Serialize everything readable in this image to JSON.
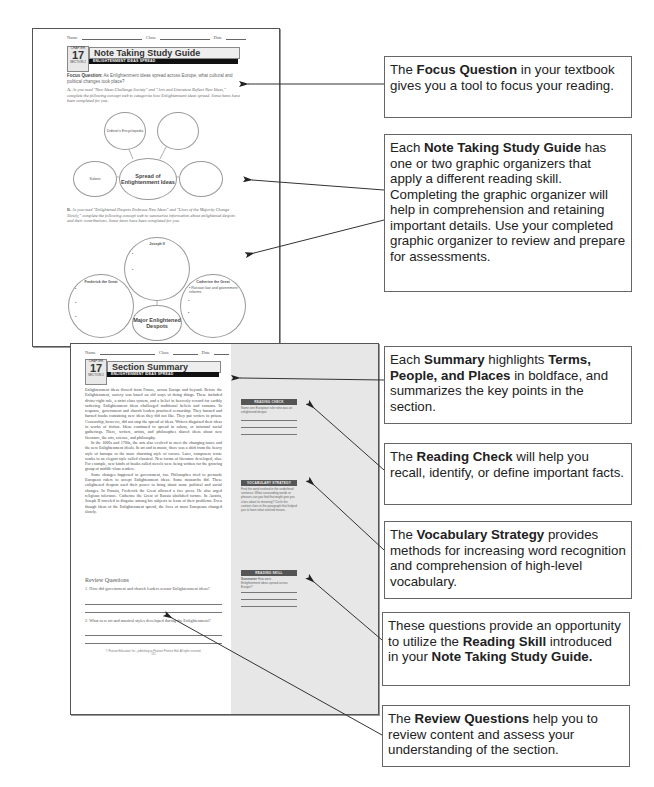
{
  "note_taking_page": {
    "name_label": "Name",
    "class_label": "Class",
    "date_label": "Date",
    "chapter_label": "CHAPTER",
    "chapter_number": "17",
    "section_label": "SECTION 2",
    "title": "Note Taking Study Guide",
    "subtitle": "ENLIGHTENMENT IDEAS SPREAD",
    "focus_question_label": "Focus Question:",
    "focus_question_text": "As Enlightenment ideas spread across Europe, what cultural and political changes took place?",
    "part_a_letter": "A.",
    "part_a_text": "As you read \"New Ideas Challenge Society\" and \"Arts and Literature Reflect New Ideas,\" complete the following concept web to categorize how Enlightenment ideas spread. Some items have been completed for you.",
    "web_a": {
      "center": "Spread of Enlightenment Ideas",
      "top_left": "Diderot's Encyclopedia",
      "top_right": "",
      "left": "Salons",
      "right": ""
    },
    "part_b_letter": "B.",
    "part_b_text": "As you read \"Enlightened Despots Embrace New Ideas\" and \"Lives of the Majority Change Slowly,\" complete the following concept web to summarize information about enlightened despots and their contributions. Some items have been completed for you.",
    "web_b": {
      "center": "Major Enlightened Despots",
      "top": "Joseph II",
      "left": "Frederick the Great",
      "right": "Catherine the Great",
      "right_item": "Russian law and government reforms",
      "bullet": "•"
    }
  },
  "summary_page": {
    "name_label": "Name",
    "class_label": "Class",
    "date_label": "Date",
    "chapter_label": "CHAPTER",
    "chapter_number": "17",
    "section_label": "SECTION 2",
    "title": "Section Summary",
    "subtitle": "ENLIGHTENMENT IDEAS SPREAD",
    "paragraph_1": "Enlightenment ideas flowed from France, across Europe and beyond. Before the Enlightenment, society was based on old ways of doing things. These included divine-right rule, a strict class system, and a belief in heavenly reward for earthly suffering. Enlightenment ideas challenged traditional beliefs and customs. In response, government and church leaders practiced censorship. They banned and burned books containing new ideas they did not like. They put writers in prison. Censorship, however, did not stop the spread of ideas. Writers disguised their ideas in works of fiction. Ideas continued to spread in salons, or informal social gatherings. There, writers, artists, and philosophes shared ideas about new literature, the arts, science, and philosophy.",
    "paragraph_2": "In the 1600s and 1700s, the arts also evolved to meet the changing tastes and the new Enlightenment ideals. In art and in music, there was a shift from the heavy style of baroque to the more charming style of rococo. Later, composers wrote works in an elegant style called classical. New forms of literature developed, also. For example, new kinds of books called novels were being written for the growing group of middle-class readers.",
    "paragraph_3": "Some changes happened in government, too. Philosophes tried to persuade European rulers to accept Enlightenment ideas. Some monarchs did. These enlightened despots used their power to bring about some political and social changes. In Prussia, Frederick the Great allowed a free press. He also urged religious tolerance. Catherine the Great of Russia abolished torture. In Austria, Joseph II traveled in disguise among his subjects to learn of their problems. Even though ideas of the Enlightenment spread, the lives of most Europeans changed slowly.",
    "review_heading": "Review Questions",
    "questions": [
      "1. How did government and church leaders censor Enlightenment ideas?",
      "2. What new art and musical styles developed during the Enlightenment?"
    ],
    "footer": "© Pearson Education, Inc., publishing as Pearson Prentice Hall. All rights reserved.",
    "page_number": "151",
    "sidebar": {
      "reading_check_title": "READING CHECK",
      "reading_check_text": "Name one European ruler who was an enlightened despot.",
      "vocab_title": "VOCABULARY STRATEGY",
      "vocab_text": "Find the word evolved in the underlined sentence. What surrounding words or phrases can you find that might give you clues about its meaning? Circle the context clues in the paragraph that helped you to learn what evolved means.",
      "skill_title": "READING SKILL",
      "skill_label": "Summarize",
      "skill_text": "How were Enlightenment ideas spread across Europe?"
    }
  },
  "callouts": [
    {
      "pre": "The ",
      "bold": "Focus Question",
      "post": " in your textbook gives you a tool to focus your reading."
    },
    {
      "pre": "Each ",
      "bold": "Note Taking Study Guide",
      "post": " has one or two graphic organizers that apply a different reading skill. Completing the graphic organizer will help in comprehension and retaining important details. Use your completed graphic organizer to review and prepare for assessments."
    },
    {
      "pre": "Each ",
      "bold": "Summary",
      "mid": " highlights ",
      "bold2": "Terms, People, and Places",
      "post": " in boldface, and summarizes the key points in the section."
    },
    {
      "pre": "The ",
      "bold": "Reading Check",
      "post": " will help you recall, identify, or define important facts."
    },
    {
      "pre": "The ",
      "bold": "Vocabulary Strategy",
      "post": " provides methods for increasing word recognition and comprehension of high-level vocabulary."
    },
    {
      "pre": "These questions provide an opportunity to utilize the ",
      "bold": "Reading Skill",
      "post": " introduced in your ",
      "bold2": "Note Taking Study Guide."
    },
    {
      "pre": "The ",
      "bold": "Review Questions",
      "post": " help you to review content and assess your understanding of the section."
    }
  ]
}
